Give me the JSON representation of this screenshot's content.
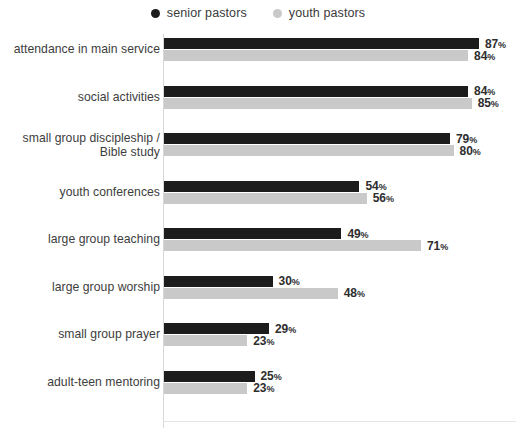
{
  "legend": {
    "items": [
      {
        "label": "senior pastors",
        "color": "#1c1c1c",
        "icon": "dot-icon"
      },
      {
        "label": "youth pastors",
        "color": "#c9c9c9",
        "icon": "dot-icon"
      }
    ]
  },
  "chart_data": {
    "type": "bar",
    "orientation": "horizontal",
    "title": "",
    "subtitle": "",
    "xlabel": "",
    "ylabel": "",
    "xlim": [
      0,
      100
    ],
    "grid": false,
    "legend_position": "top-center",
    "value_suffix": "%",
    "categories": [
      "attendance in main service",
      "social activities",
      "small group discipleship /\nBible study",
      "youth conferences",
      "large group teaching",
      "large group worship",
      "small group prayer",
      "adult-teen mentoring"
    ],
    "series": [
      {
        "name": "senior pastors",
        "color": "#1c1c1c",
        "values": [
          87,
          84,
          79,
          54,
          49,
          30,
          29,
          25
        ],
        "labels": [
          "87%",
          "84%",
          "79%",
          "54%",
          "49%",
          "30%",
          "29%",
          "25%"
        ]
      },
      {
        "name": "youth pastors",
        "color": "#c9c9c9",
        "values": [
          84,
          85,
          80,
          56,
          71,
          48,
          23,
          23
        ],
        "labels": [
          "84%",
          "85%",
          "80%",
          "56%",
          "71%",
          "48%",
          "23%",
          "23%"
        ]
      }
    ]
  }
}
